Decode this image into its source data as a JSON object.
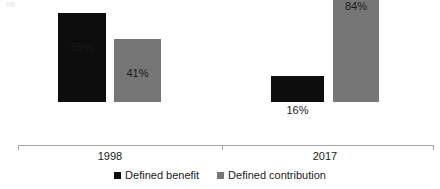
{
  "chart_data": {
    "type": "bar",
    "title": "",
    "subtitle": "",
    "xlabel": "",
    "ylabel": "",
    "grid": false,
    "legend_position": "bottom-center",
    "axis": {
      "visible_axis": "x-baseline-only",
      "tick_labels_y": [],
      "ylim": [
        0,
        100
      ],
      "value_suffix": "%"
    },
    "categories": [
      "1998",
      "2017"
    ],
    "series": [
      {
        "name": "Defined benefit",
        "color": "#0d0d0d",
        "values": [
          59,
          41
        ],
        "value_labels": [
          "59%",
          "16%"
        ]
      },
      {
        "name": "Defined contribution",
        "color": "#767676",
        "values": [
          41,
          84
        ],
        "value_labels": [
          "41%",
          "84%"
        ]
      }
    ],
    "points": [
      {
        "category": "1998",
        "series": "Defined benefit",
        "value": 59,
        "label": "59%"
      },
      {
        "category": "1998",
        "series": "Defined contribution",
        "value": 41,
        "label": "41%"
      },
      {
        "category": "2017",
        "series": "Defined benefit",
        "value": 16,
        "label": "16%"
      },
      {
        "category": "2017",
        "series": "Defined contribution",
        "value": 84,
        "label": "84%"
      }
    ]
  },
  "labels": {
    "cat_1998": "1998",
    "cat_2017": "2017",
    "val_1998_benefit": "59%",
    "val_1998_contribution": "41%",
    "val_2017_benefit": "16%",
    "val_2017_contribution": "84%"
  },
  "legend": {
    "items": [
      {
        "label": "Defined benefit",
        "color": "#0d0d0d"
      },
      {
        "label": "Defined contribution",
        "color": "#767676"
      }
    ]
  },
  "colors": {
    "defined_benefit": "#0d0d0d",
    "defined_contribution": "#767676",
    "axis": "#a6a6a6",
    "text": "#1a1a1a",
    "background": "#ffffff"
  }
}
